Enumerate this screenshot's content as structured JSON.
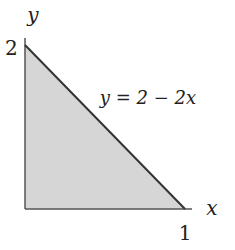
{
  "diagram": {
    "type": "shaded-triangle-region",
    "axes": {
      "x_label": "x",
      "y_label": "y"
    },
    "ticks": {
      "x_intercept_label": "1",
      "y_intercept_label": "2"
    },
    "curve_label": "y = 2 − 2x",
    "colors": {
      "fill": "#d6d6d6",
      "stroke": "#333333",
      "axis": "#555555"
    }
  }
}
